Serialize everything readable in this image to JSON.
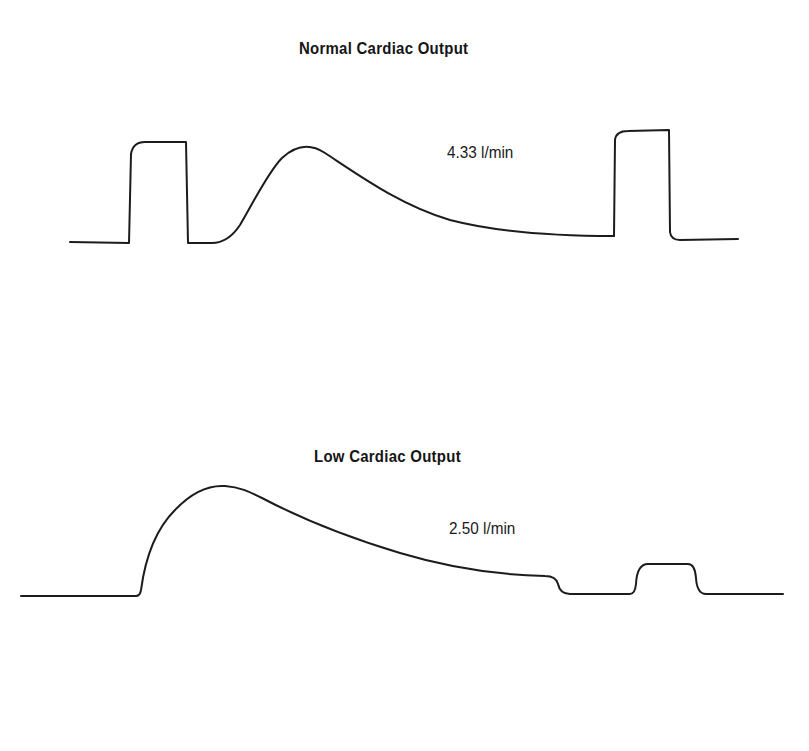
{
  "panels": [
    {
      "title": "Normal Cardiac Output",
      "value_label": "4.33 l/min",
      "cardiac_output": 4.33,
      "unit": "l/min"
    },
    {
      "title": "Low Cardiac Output",
      "value_label": "2.50 l/min",
      "cardiac_output": 2.5,
      "unit": "l/min"
    }
  ],
  "colors": {
    "background": "#ffffff",
    "trace": "#1c1c1c",
    "text": "#151515"
  }
}
